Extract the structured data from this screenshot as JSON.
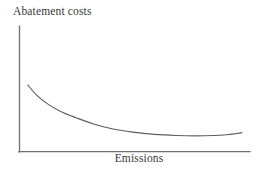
{
  "figure": {
    "background_color": "#ffffff",
    "axis_color": "#6f6f71",
    "curve_color": "#5d5d5f",
    "text_color": "#38383a"
  },
  "chart_data": {
    "type": "line",
    "title": "",
    "subtitle": "",
    "xlabel": "Emissions",
    "ylabel": "Abatement costs",
    "grid": false,
    "legend": null,
    "legend_position": "none",
    "xlim": [
      0,
      100
    ],
    "ylim": [
      0,
      100
    ],
    "xticks": [],
    "yticks": [],
    "xticklabels": [],
    "yticklabels": [],
    "annotations": [],
    "series": [
      {
        "name": "Marginal abatement cost",
        "shape": "convex decreasing, flattening to a shallow minimum then a slight upturn",
        "x": [
          2,
          6,
          11,
          17,
          24,
          32,
          41,
          50,
          60,
          70,
          79,
          87,
          93,
          97,
          100
        ],
        "y": [
          53,
          45,
          38,
          32,
          27,
          22,
          18,
          15.5,
          13.7,
          12.8,
          12.5,
          12.8,
          13.4,
          14.2,
          15.0
        ]
      }
    ]
  },
  "labels": {
    "y_axis": "Abatement costs",
    "x_axis": "Emissions"
  },
  "icons": {
    "y_axis_line": "vertical-axis-line",
    "x_axis_line": "horizontal-axis-line"
  }
}
